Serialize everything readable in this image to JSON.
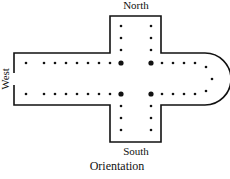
{
  "labels": {
    "north": "North",
    "south": "South",
    "west": "West",
    "caption": "Orientation"
  },
  "colors": {
    "ink": "#111111",
    "background": "#ffffff"
  },
  "columns": {
    "nave_north_row_count": 8,
    "nave_south_row_count": 8,
    "crossing_piers": 4,
    "transept_north_count": 6,
    "transept_south_count": 6,
    "chancel_north_row_count": 4,
    "chancel_south_row_count": 4,
    "apse_count": 3
  }
}
